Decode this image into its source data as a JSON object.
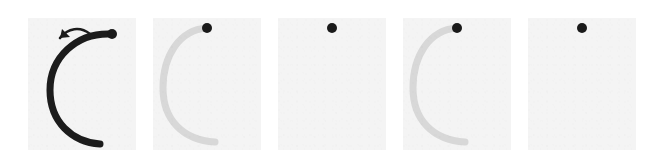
{
  "figure": {
    "type": "stroke-sequence",
    "panel_count": 5,
    "background_color": "#f4f4f4",
    "page_background": "#ffffff",
    "dot_color": "#1a1a1a",
    "stroke_dark_color": "#1c1c1c",
    "stroke_faint_color": "#d8d8d8",
    "arrow_color": "#1c1c1c",
    "stroke_shape": "c-arc-open-right",
    "panels": [
      {
        "index": 1,
        "name": "panel-1",
        "stroke_visible": true,
        "stroke_color": "#1c1c1c",
        "stroke_width": 7,
        "dot_visible": true,
        "dot_radius": 5,
        "dot_x": 84,
        "dot_y": 16,
        "arrow_visible": true,
        "arrow_direction": "counter-clockwise",
        "caption": ""
      },
      {
        "index": 2,
        "name": "panel-2",
        "stroke_visible": true,
        "stroke_color": "#d8d8d8",
        "stroke_width": 7,
        "dot_visible": true,
        "dot_radius": 5,
        "dot_x": 54,
        "dot_y": 10,
        "arrow_visible": false,
        "arrow_direction": "",
        "caption": ""
      },
      {
        "index": 3,
        "name": "panel-3",
        "stroke_visible": false,
        "stroke_color": "#d8d8d8",
        "stroke_width": 7,
        "dot_visible": true,
        "dot_radius": 5,
        "dot_x": 54,
        "dot_y": 10,
        "arrow_visible": false,
        "arrow_direction": "",
        "caption": ""
      },
      {
        "index": 4,
        "name": "panel-4",
        "stroke_visible": true,
        "stroke_color": "#d8d8d8",
        "stroke_width": 7,
        "dot_visible": true,
        "dot_radius": 5,
        "dot_x": 54,
        "dot_y": 10,
        "arrow_visible": false,
        "arrow_direction": "",
        "caption": ""
      },
      {
        "index": 5,
        "name": "panel-5",
        "stroke_visible": false,
        "stroke_color": "#d8d8d8",
        "stroke_width": 7,
        "dot_visible": true,
        "dot_radius": 5,
        "dot_x": 54,
        "dot_y": 10,
        "arrow_visible": false,
        "arrow_direction": "",
        "caption": ""
      }
    ],
    "arc_path": "M 84 16 C 48 14, 22 40, 22 72 C 22 104, 44 124, 72 126",
    "arc_path_faint": "M 54 10 C 26 12, 10 38, 10 70 C 10 102, 30 122, 62 124",
    "arrow_path": "M 62 16 C 52 8, 40 10, 32 20",
    "arrow_head_points": "32,20 42,19 34,11"
  }
}
